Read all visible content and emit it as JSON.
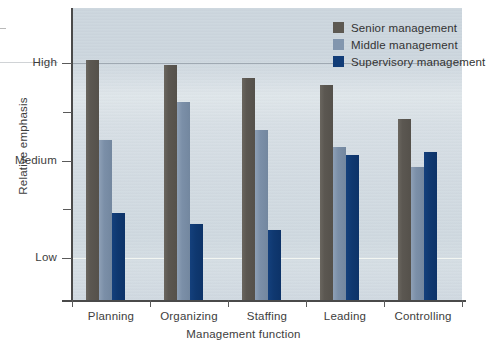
{
  "chart_data": {
    "type": "bar",
    "title": "",
    "xlabel": "Management function",
    "ylabel": "Relative emphasis",
    "categories": [
      "Planning",
      "Organizing",
      "Staffing",
      "Leading",
      "Controlling"
    ],
    "ytick_labels": [
      "Low",
      "Medium",
      "High"
    ],
    "ytick_values": [
      1,
      2,
      3
    ],
    "ylim": [
      0.5,
      3.25
    ],
    "grid": true,
    "legend_position": "top-right",
    "series": [
      {
        "name": "Senior management",
        "color": "#5d5952",
        "values": [
          3.03,
          2.98,
          2.85,
          2.77,
          2.43
        ]
      },
      {
        "name": "Middle management",
        "color": "#8296ae",
        "values": [
          2.21,
          2.6,
          2.31,
          2.14,
          1.93
        ]
      },
      {
        "name": "Supervisory management",
        "color": "#123d78",
        "values": [
          1.46,
          1.35,
          1.29,
          2.06,
          2.09
        ]
      }
    ]
  },
  "axes": {
    "y_title": "Relative emphasis",
    "x_title": "Management function",
    "y_labels": [
      {
        "text": "High",
        "value": 3
      },
      {
        "text": "Medium",
        "value": 2
      },
      {
        "text": "Low",
        "value": 1
      }
    ]
  },
  "legend": {
    "items": [
      {
        "label": "Senior management",
        "swatch": "senior"
      },
      {
        "label": "Middle management",
        "swatch": "middle"
      },
      {
        "label": "Supervisory management",
        "swatch": "supervisory"
      }
    ]
  },
  "colors": {
    "senior": "#5d5952",
    "middle": "#8296ae",
    "supervisory": "#123d78",
    "plot_background": "#d2dbe2",
    "axis": "#4a4a4a",
    "text": "#3d3d3d"
  }
}
